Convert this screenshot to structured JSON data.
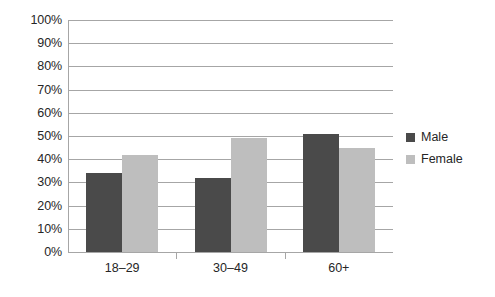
{
  "chart_data": {
    "type": "bar",
    "title": "",
    "subtitle": "",
    "xlabel": "",
    "ylabel": "",
    "categories": [
      "18–29",
      "30–49",
      "60+"
    ],
    "series": [
      {
        "name": "Male",
        "values": [
          34,
          32,
          51
        ],
        "color": "#4a4a4a"
      },
      {
        "name": "Female",
        "values": [
          42,
          49,
          45
        ],
        "color": "#bebebe"
      }
    ],
    "ylim": [
      0,
      100
    ],
    "y_tick_values": [
      0,
      10,
      20,
      30,
      40,
      50,
      60,
      70,
      80,
      90,
      100
    ],
    "y_tick_labels": [
      "0%",
      "10%",
      "20%",
      "30%",
      "40%",
      "50%",
      "60%",
      "70%",
      "80%",
      "90%",
      "100%"
    ],
    "grid": true,
    "grid_axis": "y",
    "legend_position": "right",
    "value_suffix": "%",
    "colors": {
      "male": "#4a4a4a",
      "female": "#bebebe",
      "axis": "#a6a6a6",
      "grid": "#a6a6a6",
      "text": "#262626",
      "background": "#ffffff"
    }
  },
  "legend": {
    "items": [
      {
        "label": "Male",
        "swatch": "male-legend-swatch"
      },
      {
        "label": "Female",
        "swatch": "female-legend-swatch"
      }
    ]
  }
}
